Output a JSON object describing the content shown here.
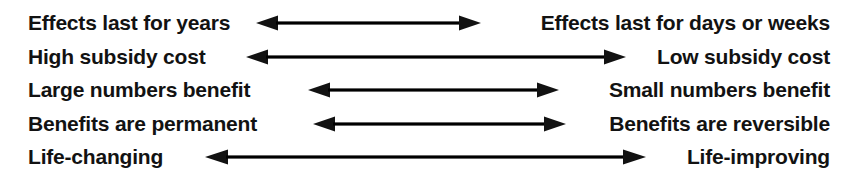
{
  "diagram": {
    "type": "bidirectional-comparison-spectrum",
    "title": "",
    "background_color": "#ffffff",
    "text_color": "#121212",
    "arrow_color": "#121212",
    "rows": [
      {
        "id": "row-1",
        "left_label": "Effects last for years",
        "right_label": "Effects last for days or weeks",
        "arrow": "double-headed-arrow",
        "arrow_left_px": 256,
        "arrow_right_px": 481
      },
      {
        "id": "row-2",
        "left_label": "High subsidy cost",
        "right_label": "Low subsidy cost",
        "arrow": "double-headed-arrow",
        "arrow_left_px": 246,
        "arrow_right_px": 626
      },
      {
        "id": "row-3",
        "left_label": "Large numbers benefit",
        "right_label": "Small numbers benefit",
        "arrow": "double-headed-arrow",
        "arrow_left_px": 308,
        "arrow_right_px": 559
      },
      {
        "id": "row-4",
        "left_label": "Benefits are permanent",
        "right_label": "Benefits are reversible",
        "arrow": "double-headed-arrow",
        "arrow_left_px": 313,
        "arrow_right_px": 566
      },
      {
        "id": "row-5",
        "left_label": "Life-changing",
        "right_label": "Life-improving",
        "arrow": "double-headed-arrow",
        "arrow_left_px": 205,
        "arrow_right_px": 646
      }
    ]
  }
}
